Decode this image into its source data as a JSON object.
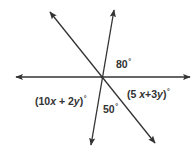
{
  "diagram": {
    "type": "intersecting-lines",
    "line_color": "#333333",
    "intersection": {
      "x": 102,
      "y": 77
    },
    "lines": [
      {
        "name": "horizontal-line",
        "x1": 16,
        "y1": 77,
        "x2": 190,
        "y2": 77,
        "arrows": "both"
      },
      {
        "name": "steep-line",
        "x1": 114,
        "y1": 10,
        "x2": 91,
        "y2": 145,
        "arrows": "both"
      },
      {
        "name": "diagonal-line",
        "x1": 50,
        "y1": 12,
        "x2": 155,
        "y2": 143,
        "arrows": "both"
      }
    ],
    "angles": {
      "top_right": {
        "value": "80",
        "unit": "°"
      },
      "bottom": {
        "value": "50",
        "unit": "°"
      },
      "left": {
        "prefix": "(10",
        "var1": "x",
        "mid": " + 2",
        "var2": "y",
        "suffix": ")",
        "unit": "°"
      },
      "right": {
        "prefix": "(5 ",
        "var1": "x",
        "mid": "+3",
        "var2": "y",
        "suffix": ")",
        "unit": "°"
      }
    }
  }
}
